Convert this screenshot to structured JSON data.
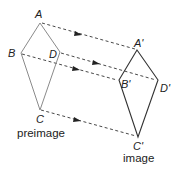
{
  "diagram": {
    "preimage": {
      "caption": "preimage",
      "vertices": {
        "A": {
          "label": "A",
          "x": 40,
          "y": 23
        },
        "B": {
          "label": "B",
          "x": 21,
          "y": 53
        },
        "D": {
          "label": "D",
          "x": 60,
          "y": 52
        },
        "C": {
          "label": "C",
          "x": 40,
          "y": 110
        }
      }
    },
    "image": {
      "caption": "image",
      "vertices": {
        "A": {
          "label": "A'",
          "x": 137,
          "y": 50
        },
        "B": {
          "label": "B'",
          "x": 119,
          "y": 80
        },
        "D": {
          "label": "D'",
          "x": 158,
          "y": 80
        },
        "C": {
          "label": "C'",
          "x": 138,
          "y": 137
        }
      }
    },
    "translation_arrows": [
      {
        "from": "A",
        "to": "A'"
      },
      {
        "from": "B",
        "to": "B'"
      },
      {
        "from": "D",
        "to": "D'"
      },
      {
        "from": "C",
        "to": "C'"
      }
    ],
    "colors": {
      "preimage_stroke": "#8a8a8a",
      "image_stroke": "#333333",
      "arrow": "#222222"
    }
  }
}
